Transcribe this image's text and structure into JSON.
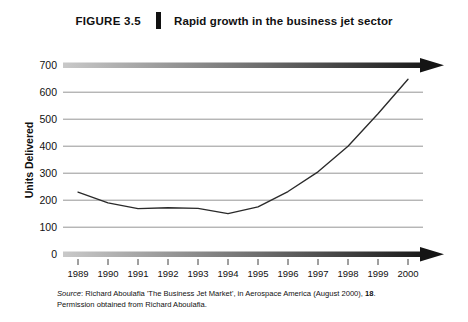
{
  "header": {
    "figure_label": "FIGURE 3.5",
    "title": "Rapid growth in the business jet sector"
  },
  "chart_data": {
    "type": "line",
    "title": "Rapid growth in the business jet sector",
    "xlabel": "",
    "ylabel": "Units Delivered",
    "categories": [
      "1989",
      "1990",
      "1991",
      "1992",
      "1993",
      "1994",
      "1995",
      "1996",
      "1997",
      "1998",
      "1999",
      "2000"
    ],
    "values": [
      230,
      190,
      169,
      172,
      170,
      150,
      175,
      232,
      305,
      400,
      520,
      648
    ],
    "series": [
      {
        "name": "Units Delivered",
        "values": [
          230,
          190,
          169,
          172,
          170,
          150,
          175,
          232,
          305,
          400,
          520,
          648
        ]
      }
    ],
    "ylim": [
      0,
      700
    ],
    "ytick_labels": [
      "700",
      "600",
      "500",
      "400",
      "300",
      "200",
      "100",
      "0"
    ],
    "ytick_values": [
      700,
      600,
      500,
      400,
      300,
      200,
      100,
      0
    ],
    "xtick_labels": [
      "1989",
      "1990",
      "1991",
      "1992",
      "1993",
      "1994",
      "1995",
      "1996",
      "1997",
      "1998",
      "1999",
      "2000"
    ],
    "grid": true,
    "legend": "none",
    "line_color": "#2a2a2a",
    "grid_color": "#8a8a8a",
    "axis_color": "#1a1a1a"
  },
  "source": {
    "label": "Source",
    "text": ": Richard Aboulafia 'The Business Jet Market', in Aerospace America (August 2000), ",
    "page": "18",
    "text_end": ".",
    "line2": "Permission obtained from Richard Aboulafia."
  }
}
